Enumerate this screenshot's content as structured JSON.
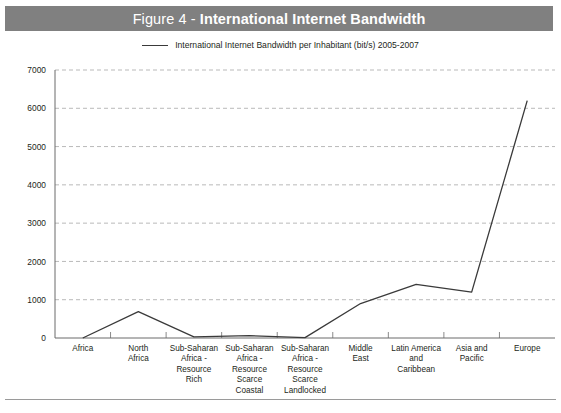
{
  "figure": {
    "title_prefix": "Figure 4 - ",
    "title_main": "International Internet Bandwidth",
    "band_color": "#808080",
    "title_color": "#ffffff"
  },
  "legend": {
    "swatch_name": "line-swatch",
    "label": "International Internet Bandwidth per Inhabitant (bit/s) 2005-2007",
    "line_color": "#3a3a3a"
  },
  "chart_data": {
    "type": "line",
    "title": "Figure 4 - International Internet Bandwidth",
    "xlabel": "",
    "ylabel": "",
    "ylim": [
      0,
      7000
    ],
    "yticks": [
      0,
      1000,
      2000,
      3000,
      4000,
      5000,
      6000,
      7000
    ],
    "ytick_labels": [
      "0",
      "1000",
      "2000",
      "3000",
      "4000",
      "5000",
      "6000",
      "7000"
    ],
    "grid": true,
    "grid_style": "dashed",
    "grid_color": "#b9b9b9",
    "legend_position": "top-center",
    "line_color": "#3a3a3a",
    "categories": [
      "Africa",
      "North Africa",
      "Sub-Saharan Africa - Resource Rich",
      "Sub-Saharan Africa - Resource Scarce Coastal",
      "Sub-Saharan Africa - Resource Scarce Landlocked",
      "Middle East",
      "Latin America and Caribbean",
      "Asia and Pacific",
      "Europe"
    ],
    "category_label_lines": [
      [
        "Africa"
      ],
      [
        "North",
        "Africa"
      ],
      [
        "Sub-Saharan",
        "Africa -",
        "Resource Rich"
      ],
      [
        "Sub-Saharan",
        "Africa -",
        "Resource",
        "Scarce",
        "Coastal"
      ],
      [
        "Sub-Saharan",
        "Africa -",
        "Resource",
        "Scarce",
        "Landlocked"
      ],
      [
        "Middle",
        "East"
      ],
      [
        "Latin America",
        "and Caribbean"
      ],
      [
        "Asia and",
        "Pacific"
      ],
      [
        "Europe"
      ]
    ],
    "series": [
      {
        "name": "International Internet Bandwidth per Inhabitant (bit/s) 2005-2007",
        "values": [
          0,
          690,
          30,
          60,
          10,
          900,
          1400,
          1200,
          6200
        ]
      }
    ]
  }
}
